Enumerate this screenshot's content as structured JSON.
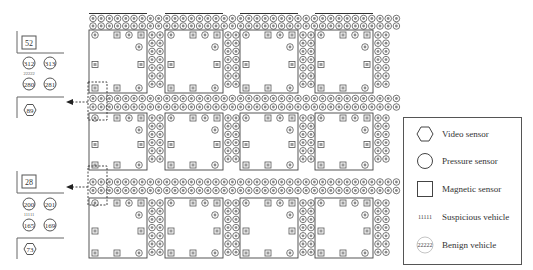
{
  "figure": {
    "type": "smart-city sensor grid diagram",
    "grid": {
      "block_columns": 4,
      "block_rows": 3,
      "street_rows_per_horizontal_street": 2,
      "street_cols_per_vertical_street": 2
    }
  },
  "legend": {
    "items": [
      {
        "symbol": "hexagon",
        "label": "Video sensor"
      },
      {
        "symbol": "circle",
        "label": "Pressure sensor"
      },
      {
        "symbol": "square",
        "label": "Magnetic sensor"
      },
      {
        "symbol": "text",
        "glyph": "11111",
        "label": "Suspicious vehicle"
      },
      {
        "symbol": "dashed-circle",
        "glyph": "22222",
        "label": "Benign vehicle"
      }
    ]
  },
  "detail_top": {
    "magnetic_sensor_id": "52",
    "pressure_sensors": [
      "312",
      "313",
      "280",
      "281"
    ],
    "vehicle_tag": "22222",
    "video_sensor_id": "89"
  },
  "detail_bottom": {
    "magnetic_sensor_id": "28",
    "pressure_sensors": [
      "200",
      "201",
      "165",
      "169"
    ],
    "vehicle_tag": "11111",
    "video_sensor_id": "73"
  }
}
